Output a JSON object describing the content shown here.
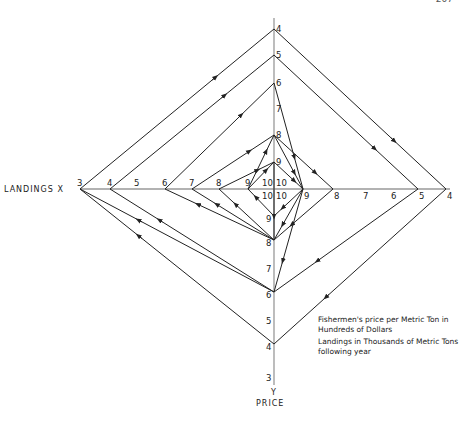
{
  "page": {
    "number": "207"
  },
  "chart_data": {
    "type": "cobweb",
    "x_axis": {
      "label": "LANDINGS X",
      "left_ticks": [
        "3",
        "4",
        "5",
        "6",
        "7",
        "8",
        "9",
        "10"
      ],
      "right_ticks": [
        "10",
        "9",
        "8",
        "7",
        "6",
        "5",
        "4"
      ]
    },
    "y_axis": {
      "label_letter": "Y",
      "label": "PRICE",
      "top_ticks": [
        "4",
        "5",
        "6",
        "7",
        "8",
        "9",
        "10"
      ],
      "bottom_ticks": [
        "10",
        "9",
        "8",
        "7",
        "6",
        "5",
        "4",
        "3"
      ]
    },
    "center_labels": [
      "10",
      "10",
      "10",
      "10"
    ],
    "legend": [
      "Fishermen's price per Metric Ton in Hundreds of Dollars",
      "Landings in Thousands of Metric Tons following year"
    ],
    "path_vertices": [
      {
        "axis": "left",
        "value": 9
      },
      {
        "axis": "top",
        "value": 9
      },
      {
        "axis": "right",
        "value": 9
      },
      {
        "axis": "bottom",
        "value": 9
      },
      {
        "axis": "left",
        "value": 9
      },
      {
        "axis": "top",
        "value": 8
      },
      {
        "axis": "right",
        "value": 9
      },
      {
        "axis": "bottom",
        "value": 8
      },
      {
        "axis": "left",
        "value": 8
      },
      {
        "axis": "top",
        "value": 9
      },
      {
        "axis": "bottom",
        "value": 8
      },
      {
        "axis": "left",
        "value": 7
      },
      {
        "axis": "top",
        "value": 8
      },
      {
        "axis": "right",
        "value": 8
      },
      {
        "axis": "bottom",
        "value": 8
      },
      {
        "axis": "left",
        "value": 6
      },
      {
        "axis": "top",
        "value": 6
      },
      {
        "axis": "right",
        "value": 9
      },
      {
        "axis": "bottom",
        "value": 6
      },
      {
        "axis": "left",
        "value": 4
      },
      {
        "axis": "top",
        "value": 5
      },
      {
        "axis": "right",
        "value": 5
      },
      {
        "axis": "bottom",
        "value": 6
      },
      {
        "axis": "left",
        "value": 3
      },
      {
        "axis": "top",
        "value": 4
      },
      {
        "axis": "right",
        "value": 4
      },
      {
        "axis": "bottom",
        "value": 4
      },
      {
        "axis": "left",
        "value": 3
      }
    ]
  }
}
